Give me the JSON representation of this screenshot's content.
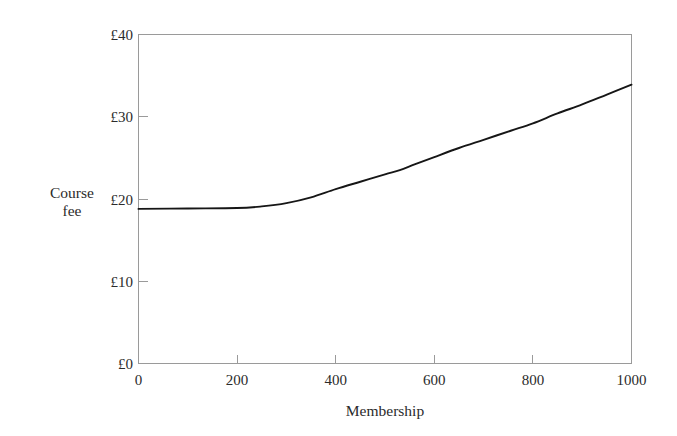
{
  "figure": {
    "background_color": "#ffffff",
    "frame_color": "#9a9a9a",
    "curve_color": "#161616"
  },
  "chart_data": {
    "type": "line",
    "title": "",
    "subtitle": "",
    "xlabel": "Membership",
    "ylabel": "Course fee",
    "ylabel_lines": [
      "Course",
      "fee"
    ],
    "xlim": [
      0,
      1000
    ],
    "ylim": [
      0,
      40
    ],
    "grid": false,
    "legend": false,
    "legend_position": "none",
    "x_tick_values": [
      0,
      200,
      400,
      600,
      800,
      1000
    ],
    "x_tick_labels": [
      "0",
      "200",
      "400",
      "600",
      "800",
      "1000"
    ],
    "y_tick_values": [
      0,
      10,
      20,
      30,
      40
    ],
    "y_tick_labels": [
      "£0",
      "£10",
      "£20",
      "£30",
      "£40"
    ],
    "y_unit_prefix": "£",
    "tick_direction": "in",
    "series": [
      {
        "name": "Course fee",
        "x": [
          0,
          100,
          200,
          250,
          300,
          350,
          400,
          450,
          500,
          530,
          560,
          600,
          650,
          700,
          755,
          800,
          850,
          900,
          950,
          1000
        ],
        "values": [
          18.8,
          18.85,
          18.9,
          19.1,
          19.5,
          20.2,
          21.2,
          22.1,
          23.0,
          23.5,
          24.2,
          25.1,
          26.2,
          27.2,
          28.3,
          29.2,
          30.4,
          31.5,
          32.7,
          33.9
        ]
      }
    ],
    "annotations": []
  },
  "axis_labels": {
    "x_title": "Membership",
    "y_title_line1": "Course",
    "y_title_line2": "fee"
  },
  "ticks": {
    "x": [
      {
        "label": "0"
      },
      {
        "label": "200"
      },
      {
        "label": "400"
      },
      {
        "label": "600"
      },
      {
        "label": "800"
      },
      {
        "label": "1000"
      }
    ],
    "y": [
      {
        "label": "£0"
      },
      {
        "label": "£10"
      },
      {
        "label": "£20"
      },
      {
        "label": "£30"
      },
      {
        "label": "£40"
      }
    ]
  }
}
